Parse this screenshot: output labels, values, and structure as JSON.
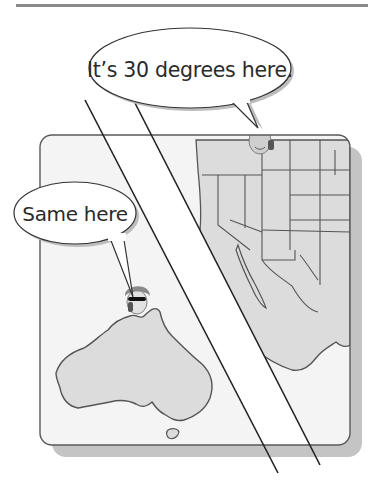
{
  "illustration": {
    "description": "Split-panel cartoon: person in North America (winter clothes) and person in Australia (summer clothes) both speaking on phones",
    "top_rule_color": "#8a8a8a",
    "panel": {
      "fill": "#ececec",
      "border": "#555555",
      "shadow": "#bdbdbd"
    },
    "left_region": {
      "name": "Australia",
      "speaker": "person-in-sunglasses",
      "speech": "Same here"
    },
    "right_region": {
      "name": "North America (USA / Mexico)",
      "speaker": "person-in-winter-hat",
      "speech": "It’s 30 degrees here."
    }
  }
}
